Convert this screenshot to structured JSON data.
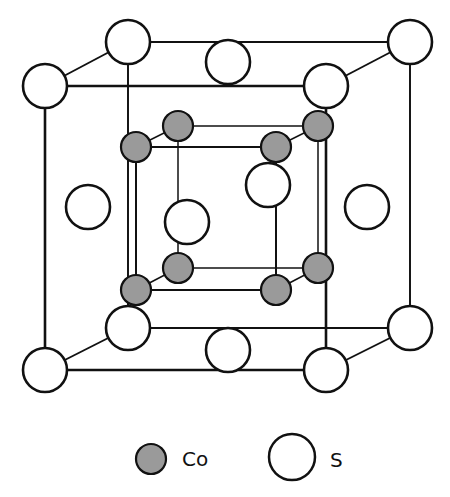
{
  "diagram": {
    "colors": {
      "co_fill": "#9a9a9a",
      "s_fill": "#ffffff",
      "stroke": "#111111"
    },
    "outer_cube": {
      "front": [
        [
          45,
          86
        ],
        [
          326,
          86
        ],
        [
          326,
          370
        ],
        [
          45,
          370
        ]
      ],
      "back": [
        [
          128,
          42
        ],
        [
          410,
          42
        ],
        [
          410,
          328
        ],
        [
          128,
          328
        ]
      ]
    },
    "inner_cube": {
      "front": [
        [
          136,
          147
        ],
        [
          276,
          147
        ],
        [
          276,
          290
        ],
        [
          136,
          290
        ]
      ],
      "back": [
        [
          178,
          126
        ],
        [
          318,
          126
        ],
        [
          318,
          268
        ],
        [
          178,
          268
        ]
      ]
    },
    "s_atoms": [
      {
        "x": 128,
        "y": 42
      },
      {
        "x": 410,
        "y": 42
      },
      {
        "x": 45,
        "y": 86
      },
      {
        "x": 326,
        "y": 86
      },
      {
        "x": 128,
        "y": 328
      },
      {
        "x": 410,
        "y": 328
      },
      {
        "x": 45,
        "y": 370
      },
      {
        "x": 326,
        "y": 370
      },
      {
        "x": 228,
        "y": 62
      },
      {
        "x": 228,
        "y": 350
      },
      {
        "x": 88,
        "y": 207
      },
      {
        "x": 367,
        "y": 207
      },
      {
        "x": 187,
        "y": 222
      },
      {
        "x": 268,
        "y": 185
      }
    ],
    "co_atoms": [
      {
        "x": 178,
        "y": 126
      },
      {
        "x": 318,
        "y": 126
      },
      {
        "x": 136,
        "y": 147
      },
      {
        "x": 276,
        "y": 147
      },
      {
        "x": 178,
        "y": 268
      },
      {
        "x": 318,
        "y": 268
      },
      {
        "x": 136,
        "y": 290
      },
      {
        "x": 276,
        "y": 290
      }
    ]
  },
  "legend": {
    "items": [
      {
        "symbol": "filled-circle",
        "label": "Co"
      },
      {
        "symbol": "open-circle",
        "label": "S"
      }
    ]
  }
}
